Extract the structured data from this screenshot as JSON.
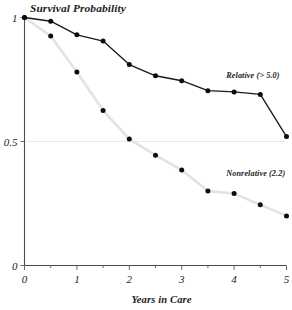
{
  "chart_data": {
    "type": "line",
    "title": "Survival Probability",
    "subtitle": "",
    "xlabel": "Years in Care",
    "ylabel": "Survival Probability",
    "xlim": [
      0,
      5
    ],
    "ylim": [
      0,
      1
    ],
    "grid": "horizontal-gridline-at-0.5-only",
    "legend_position": "inline-right-of-series",
    "x_tick_labels": [
      "0",
      "1",
      "2",
      "3",
      "4",
      "5"
    ],
    "x_tick_values": [
      0,
      1,
      2,
      3,
      4,
      5
    ],
    "x_minor_tick_values": [
      0.5,
      1.5,
      2.5,
      3.5,
      4.5
    ],
    "y_tick_labels": [
      "1",
      "0.5",
      "0"
    ],
    "y_tick_values": [
      1,
      0.5,
      0
    ],
    "x": [
      0,
      0.5,
      1,
      1.5,
      2,
      2.5,
      3,
      3.5,
      4,
      4.5,
      5
    ],
    "series": [
      {
        "name": "Relative (> 5.0)",
        "color": "#1b1b1b",
        "marker": "filled-circle",
        "values": [
          1.0,
          0.985,
          0.93,
          0.905,
          0.81,
          0.765,
          0.745,
          0.705,
          0.7,
          0.69,
          0.52
        ]
      },
      {
        "name": "Nonrelative (2.2)",
        "color": "#e3e3e3",
        "marker": "filled-circle",
        "values": [
          1.0,
          0.925,
          0.78,
          0.625,
          0.51,
          0.445,
          0.385,
          0.3,
          0.29,
          0.245,
          0.2
        ]
      }
    ],
    "annotations": [
      {
        "text": "Relative (> 5.0)",
        "x": 3.85,
        "y": 0.755
      },
      {
        "text": "Nonrelative (2.2)",
        "x": 3.85,
        "y": 0.36
      }
    ]
  }
}
